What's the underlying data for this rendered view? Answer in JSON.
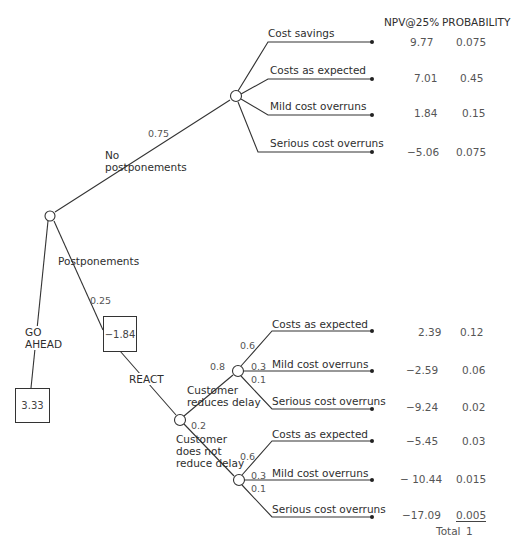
{
  "columns": {
    "npv_header": "NPV@25%",
    "probability_header": "PROBABILITY"
  },
  "decisions": {
    "go_ahead": {
      "label_line1": "GO",
      "label_line2": "AHEAD",
      "value": "3.33"
    },
    "react": {
      "label": "REACT",
      "value": "−1.84"
    }
  },
  "root_branches": {
    "no_postponements": {
      "label_line1": "No",
      "label_line2": "postponements",
      "probability": "0.75"
    },
    "postponements": {
      "label": "Postponements",
      "probability": "0.25"
    }
  },
  "no_postponement_outcomes": [
    {
      "label": "Cost savings",
      "npv": "9.77",
      "probability": "0.075"
    },
    {
      "label": "Costs as expected",
      "npv": "7.01",
      "probability": "0.45"
    },
    {
      "label": "Mild cost overruns",
      "npv": "1.84",
      "probability": "0.15"
    },
    {
      "label": "Serious cost overruns",
      "npv": "−5.06",
      "probability": "0.075"
    }
  ],
  "customer_reduces_delay": {
    "label_line1": "Customer",
    "label_line2": "reduces delay",
    "probability": "0.8",
    "branch_probs": [
      "0.6",
      "0.3",
      "0.1"
    ],
    "outcomes": [
      {
        "label": "Costs as expected",
        "npv": "2.39",
        "probability": "0.12"
      },
      {
        "label": "Mild cost overruns",
        "npv": "−2.59",
        "probability": "0.06"
      },
      {
        "label": "Serious cost overruns",
        "npv": "−9.24",
        "probability": "0.02"
      }
    ]
  },
  "customer_not_reduce_delay": {
    "label_line1": "Customer",
    "label_line2": "does not",
    "label_line3": "reduce delay",
    "probability": "0.2",
    "branch_probs": [
      "0.6",
      "0.3",
      "0.1"
    ],
    "outcomes": [
      {
        "label": "Costs as expected",
        "npv": "−5.45",
        "probability": "0.03"
      },
      {
        "label": "Mild cost overruns",
        "npv": "− 10.44",
        "probability": "0.015"
      },
      {
        "label": "Serious cost overruns",
        "npv": "−17.09",
        "probability": "0.005"
      }
    ]
  },
  "total": {
    "label": "Total",
    "value": "1"
  },
  "colors": {
    "line": "#333333",
    "text": "#2e2e2e",
    "muted": "#555555"
  }
}
